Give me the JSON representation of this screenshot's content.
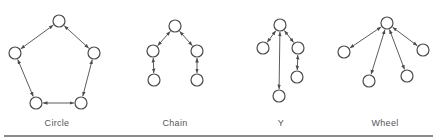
{
  "colors": {
    "stroke": "#4a4a4a",
    "node_fill": "#ffffff",
    "label": "#555555",
    "divider": "#8a8a8a"
  },
  "node_radius": 6,
  "networks": [
    {
      "name": "Circle",
      "label_x": 57,
      "nodes": [
        [
          59,
          21
        ],
        [
          94,
          53
        ],
        [
          81,
          103
        ],
        [
          36,
          103
        ],
        [
          15,
          53
        ]
      ],
      "edges": [
        [
          0,
          1
        ],
        [
          1,
          2
        ],
        [
          2,
          3
        ],
        [
          3,
          4
        ],
        [
          4,
          0
        ]
      ]
    },
    {
      "name": "Chain",
      "label_x": 175,
      "nodes": [
        [
          175,
          26
        ],
        [
          153,
          51
        ],
        [
          154,
          80
        ],
        [
          197,
          51
        ],
        [
          197,
          80
        ]
      ],
      "edges": [
        [
          0,
          1
        ],
        [
          1,
          2
        ],
        [
          0,
          3
        ],
        [
          3,
          4
        ]
      ]
    },
    {
      "name": "Y",
      "label_x": 281,
      "nodes": [
        [
          280,
          25
        ],
        [
          263,
          48
        ],
        [
          298,
          48
        ],
        [
          297,
          77
        ],
        [
          279,
          96
        ]
      ],
      "edges": [
        [
          0,
          1
        ],
        [
          0,
          2
        ],
        [
          2,
          3
        ],
        [
          0,
          4
        ]
      ]
    },
    {
      "name": "Wheel",
      "label_x": 385,
      "nodes": [
        [
          387,
          23
        ],
        [
          344,
          52
        ],
        [
          369,
          81
        ],
        [
          407,
          76
        ],
        [
          423,
          50
        ]
      ],
      "edges": [
        [
          0,
          1
        ],
        [
          0,
          2
        ],
        [
          0,
          3
        ],
        [
          0,
          4
        ]
      ]
    }
  ],
  "labels": {
    "circle": "Circle",
    "chain": "Chain",
    "y": "Y",
    "wheel": "Wheel"
  }
}
